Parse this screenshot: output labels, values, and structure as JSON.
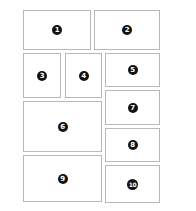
{
  "diagram": {
    "type": "layout-grid",
    "panels": [
      {
        "label": "1",
        "x": 23,
        "y": 10,
        "w": 68,
        "h": 40
      },
      {
        "label": "2",
        "x": 94,
        "y": 10,
        "w": 66,
        "h": 40
      },
      {
        "label": "3",
        "x": 23,
        "y": 53,
        "w": 38,
        "h": 45
      },
      {
        "label": "4",
        "x": 65,
        "y": 53,
        "w": 37,
        "h": 45
      },
      {
        "label": "5",
        "x": 105,
        "y": 53,
        "w": 55,
        "h": 34
      },
      {
        "label": "7",
        "x": 105,
        "y": 90,
        "w": 55,
        "h": 35
      },
      {
        "label": "6",
        "x": 23,
        "y": 101,
        "w": 79,
        "h": 51
      },
      {
        "label": "8",
        "x": 105,
        "y": 128,
        "w": 55,
        "h": 34
      },
      {
        "label": "9",
        "x": 23,
        "y": 155,
        "w": 79,
        "h": 47
      },
      {
        "label": "10",
        "x": 105,
        "y": 165,
        "w": 55,
        "h": 38
      }
    ],
    "colors": {
      "border": "#b8b8b8",
      "badge": "#111111",
      "badge_text": "#ffffff",
      "background": "#ffffff"
    }
  }
}
